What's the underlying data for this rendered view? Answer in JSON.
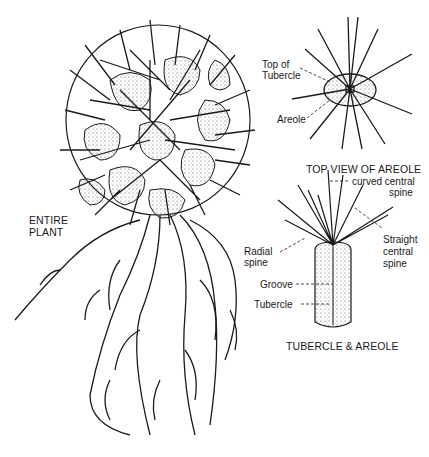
{
  "figure": {
    "sections": {
      "entire_plant": {
        "caption_line1": "ENTIRE",
        "caption_line2": "PLANT"
      },
      "top_view": {
        "caption": "TOP VIEW OF AREOLE",
        "labels": {
          "top_of_tubercle_l1": "Top of",
          "top_of_tubercle_l2": "Tubercle",
          "areole": "Areole"
        }
      },
      "tubercle_areole": {
        "caption": "TUBERCLE & AREOLE",
        "labels": {
          "curved_l1": "curved central",
          "curved_l2": "spine",
          "radial_l1": "Radial",
          "radial_l2": "spine",
          "straight_l1": "Straight",
          "straight_l2": "central",
          "straight_l3": "spine",
          "groove": "Groove",
          "tubercle": "Tubercle"
        }
      }
    },
    "colors": {
      "ink": "#1a1a1a",
      "background": "#ffffff",
      "stipple": "#555555"
    }
  }
}
